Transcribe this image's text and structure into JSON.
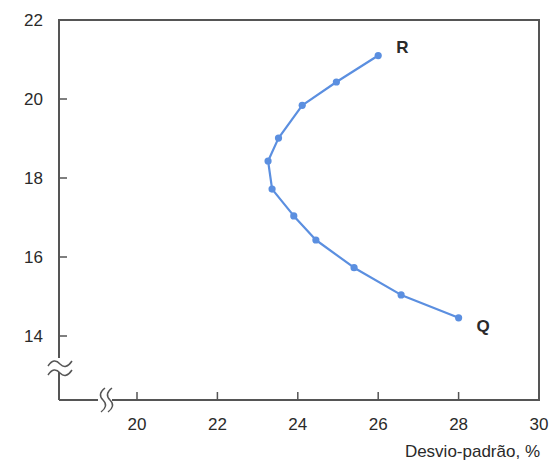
{
  "chart_data": {
    "type": "line",
    "title": "",
    "xlabel": "Desvio-padrão, %",
    "ylabel": "",
    "xlim": [
      18.5,
      30
    ],
    "ylim": [
      12.5,
      22
    ],
    "x_ticks": [
      20,
      22,
      24,
      26,
      28,
      30
    ],
    "y_ticks": [
      14,
      16,
      18,
      20,
      22
    ],
    "x_tick_labels": [
      "20",
      "22",
      "24",
      "26",
      "28",
      "30"
    ],
    "y_tick_labels": [
      "14",
      "16",
      "18",
      "20",
      "22"
    ],
    "grid": false,
    "axis_breaks": {
      "x": true,
      "y": true
    },
    "series": [
      {
        "name": "Fronteira",
        "color": "#5b8fe0",
        "x": [
          26.0,
          24.96,
          24.11,
          23.52,
          23.26,
          23.36,
          23.9,
          24.45,
          25.4,
          26.57,
          28.0
        ],
        "y": [
          21.1,
          20.43,
          19.84,
          19.01,
          18.43,
          17.72,
          17.04,
          16.43,
          15.73,
          15.04,
          14.46
        ]
      }
    ],
    "annotations": [
      {
        "text": "R",
        "x": 26.0,
        "y": 21.1
      },
      {
        "text": "Q",
        "x": 28.0,
        "y": 14.46
      }
    ]
  }
}
